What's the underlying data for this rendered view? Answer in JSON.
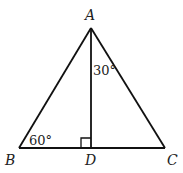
{
  "diagram": {
    "type": "geometry-triangle",
    "points": {
      "A": {
        "label": "A",
        "x": 91,
        "y": 28
      },
      "B": {
        "label": "B",
        "x": 19,
        "y": 148
      },
      "C": {
        "label": "C",
        "x": 165,
        "y": 148
      },
      "D": {
        "label": "D",
        "x": 91,
        "y": 148
      }
    },
    "segments": [
      "AB",
      "AC",
      "BC",
      "AD"
    ],
    "angles": {
      "angle_B": "60°",
      "angle_BAD": "30°"
    },
    "right_angle_at": "D",
    "colors": {
      "stroke": "#111111",
      "background": "#ffffff"
    }
  }
}
